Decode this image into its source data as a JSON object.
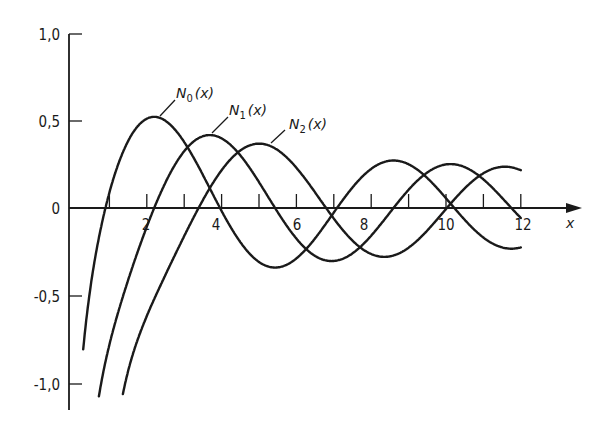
{
  "chart_data": {
    "type": "line",
    "title": "",
    "xlabel": "x",
    "ylabel": "",
    "xlim": [
      0,
      13.5
    ],
    "ylim": [
      -1.1,
      1.0
    ],
    "grid": false,
    "legend": "inline labels with leader lines",
    "x_ticks": [
      1,
      2,
      3,
      4,
      5,
      6,
      7,
      8,
      9,
      10,
      11,
      12
    ],
    "x_tick_labels": [
      "2",
      "4",
      "6",
      "8",
      "10",
      "12"
    ],
    "x_tick_label_values": [
      2,
      4,
      6,
      8,
      10,
      12
    ],
    "y_ticks": [
      1.0,
      0.5,
      0,
      -0.5,
      -1.0
    ],
    "y_tick_labels": [
      "1,0",
      "0,5",
      "0",
      "-0,5",
      "-1,0"
    ],
    "series": [
      {
        "name": "N0(x)",
        "label_main": "N",
        "label_sub": "0",
        "label_arg": "(x)",
        "x_range": [
          0.3,
          12
        ],
        "x": [
          0.5,
          1,
          1.5,
          2,
          2.5,
          3,
          3.5,
          4,
          4.5,
          5,
          5.5,
          6,
          6.5,
          7,
          7.5,
          8,
          8.5,
          9,
          9.5,
          10,
          10.5,
          11,
          11.5,
          12
        ],
        "values": [
          -0.44,
          0.09,
          0.38,
          0.51,
          0.5,
          0.38,
          0.19,
          -0.02,
          -0.19,
          -0.31,
          -0.34,
          -0.29,
          -0.17,
          -0.03,
          0.12,
          0.22,
          0.26,
          0.25,
          0.19,
          0.06,
          -0.06,
          -0.16,
          -0.23,
          -0.23
        ]
      },
      {
        "name": "N1(x)",
        "label_main": "N",
        "label_sub": "1",
        "label_arg": "(x)",
        "x_range": [
          0.72,
          12
        ],
        "x": [
          1,
          1.5,
          2,
          2.5,
          3,
          3.5,
          4,
          4.5,
          5,
          5.5,
          6,
          6.5,
          7,
          7.5,
          8,
          8.5,
          9,
          9.5,
          10,
          10.5,
          11,
          11.5,
          12
        ],
        "values": [
          -0.78,
          -0.41,
          -0.11,
          0.15,
          0.32,
          0.41,
          0.4,
          0.3,
          0.15,
          -0.02,
          -0.18,
          -0.29,
          -0.3,
          -0.26,
          -0.16,
          -0.03,
          0.1,
          0.21,
          0.25,
          0.23,
          0.16,
          0.06,
          -0.06
        ]
      },
      {
        "name": "N2(x)",
        "label_main": "N",
        "label_sub": "2",
        "label_arg": "(x)",
        "x_range": [
          1.36,
          12
        ],
        "x": [
          1.5,
          2,
          2.5,
          3,
          3.5,
          4,
          4.5,
          5,
          5.5,
          6,
          6.5,
          7,
          7.5,
          8,
          8.5,
          9,
          9.5,
          10,
          10.5,
          11,
          11.5,
          12
        ],
        "values": [
          -0.93,
          -0.62,
          -0.38,
          -0.16,
          0.05,
          0.22,
          0.33,
          0.37,
          0.34,
          0.23,
          0.1,
          -0.06,
          -0.19,
          -0.26,
          -0.26,
          -0.23,
          -0.12,
          -0.01,
          0.12,
          0.2,
          0.22,
          0.22
        ]
      }
    ]
  },
  "axis": {
    "x_label": "x",
    "y_tick_labels": [
      "1,0",
      "0,5",
      "0",
      "-0,5",
      "-1,0"
    ],
    "x_tick_labels": [
      "2",
      "4",
      "6",
      "8",
      "10",
      "12"
    ]
  },
  "labels": {
    "n0": {
      "main": "N",
      "sub": "0",
      "arg": "(x)"
    },
    "n1": {
      "main": "N",
      "sub": "1",
      "arg": "(x)"
    },
    "n2": {
      "main": "N",
      "sub": "2",
      "arg": "(x)"
    }
  }
}
